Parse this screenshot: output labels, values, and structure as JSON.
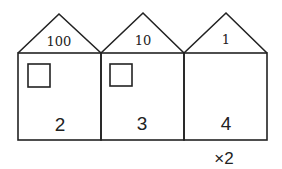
{
  "houses": [
    {
      "roof_label": "100",
      "digit": "2",
      "has_window": true
    },
    {
      "roof_label": "10",
      "digit": "3",
      "has_window": true
    },
    {
      "roof_label": "1",
      "digit": "4",
      "has_window": false
    }
  ],
  "multiplier_label": "×2",
  "colors": {
    "line": "#222222",
    "background": "#ffffff"
  }
}
